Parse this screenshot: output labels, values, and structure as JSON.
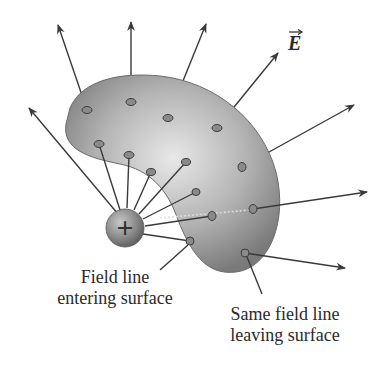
{
  "figure": {
    "field_label": "E",
    "charge_symbol": "+",
    "labels": {
      "entering_line1": "Field line",
      "entering_line2": "entering surface",
      "leaving_line1": "Same field line",
      "leaving_line2": "leaving surface"
    },
    "colors": {
      "surface_light": "#e6e6e6",
      "surface_dark": "#7a7a7a",
      "line": "#3a3a3a",
      "charge": "#8c8c8c"
    }
  }
}
